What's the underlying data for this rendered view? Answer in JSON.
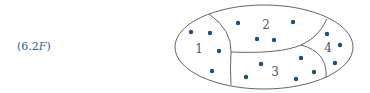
{
  "label": {
    "prefix": "(6.2",
    "italic": "F",
    "suffix": ")"
  },
  "colors": {
    "outline": "#555555",
    "dot": "#1f4e79",
    "label": "#2f5f8a"
  },
  "regions": [
    {
      "id": "1",
      "label": "1",
      "x": 199,
      "y": 53
    },
    {
      "id": "2",
      "label": "2",
      "x": 266,
      "y": 29
    },
    {
      "id": "3",
      "label": "3",
      "x": 275,
      "y": 76
    },
    {
      "id": "4",
      "label": "4",
      "x": 328,
      "y": 52
    }
  ],
  "points": [
    {
      "region": "1",
      "x": 191,
      "y": 32
    },
    {
      "region": "1",
      "x": 210,
      "y": 33
    },
    {
      "region": "1",
      "x": 219,
      "y": 51
    },
    {
      "region": "1",
      "x": 212,
      "y": 71
    },
    {
      "region": "2",
      "x": 238,
      "y": 23
    },
    {
      "region": "2",
      "x": 293,
      "y": 22
    },
    {
      "region": "2",
      "x": 257,
      "y": 39
    },
    {
      "region": "2",
      "x": 274,
      "y": 40
    },
    {
      "region": "3",
      "x": 261,
      "y": 64
    },
    {
      "region": "3",
      "x": 246,
      "y": 77
    },
    {
      "region": "3",
      "x": 301,
      "y": 58
    },
    {
      "region": "3",
      "x": 314,
      "y": 72
    },
    {
      "region": "3",
      "x": 296,
      "y": 79
    },
    {
      "region": "4",
      "x": 327,
      "y": 34
    },
    {
      "region": "4",
      "x": 340,
      "y": 45
    },
    {
      "region": "4",
      "x": 335,
      "y": 63
    }
  ]
}
